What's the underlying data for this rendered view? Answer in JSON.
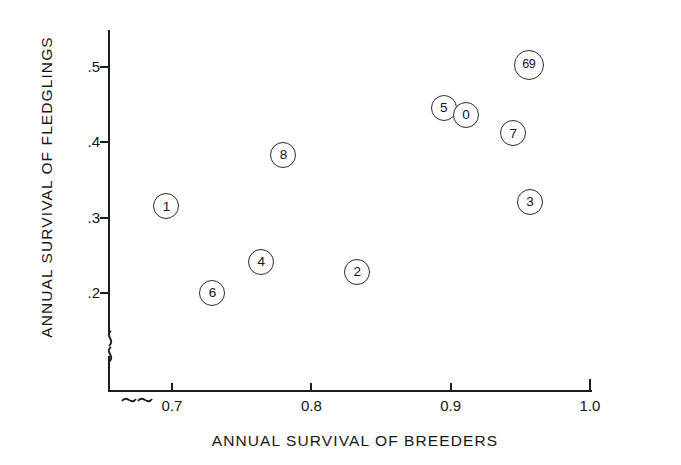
{
  "chart_data": {
    "type": "scatter",
    "title": "",
    "xlabel": "ANNUAL SURVIVAL OF BREEDERS",
    "ylabel": "ANNUAL SURVIVAL OF FLEDGLINGS",
    "xlim": [
      0.665,
      1.0
    ],
    "ylim": [
      0.165,
      0.545
    ],
    "x_ticks": [
      "0.7",
      "0.8",
      "0.9",
      "1.0"
    ],
    "x_tick_values": [
      0.7,
      0.8,
      0.9,
      1.0
    ],
    "y_ticks": [
      ".5",
      ".4",
      ".3",
      ".2"
    ],
    "y_tick_values": [
      0.5,
      0.4,
      0.3,
      0.2
    ],
    "grid": false,
    "legend": "none",
    "axis_break_x": true,
    "axis_break_y": true,
    "marker_style": "open-circle-with-label",
    "points": [
      {
        "label": "1",
        "x": 0.696,
        "y": 0.315
      },
      {
        "label": "6",
        "x": 0.729,
        "y": 0.2
      },
      {
        "label": "4",
        "x": 0.764,
        "y": 0.241
      },
      {
        "label": "8",
        "x": 0.78,
        "y": 0.383
      },
      {
        "label": "2",
        "x": 0.833,
        "y": 0.228
      },
      {
        "label": "5",
        "x": 0.895,
        "y": 0.446
      },
      {
        "label": "0",
        "x": 0.911,
        "y": 0.436
      },
      {
        "label": "69",
        "x": 0.956,
        "y": 0.503
      },
      {
        "label": "7",
        "x": 0.945,
        "y": 0.412
      },
      {
        "label": "3",
        "x": 0.957,
        "y": 0.321
      }
    ]
  },
  "colors": {
    "axis": "#1d1d1d",
    "marker_stroke": "#2b2b2b",
    "text": "#161616",
    "background": "#ffffff"
  }
}
